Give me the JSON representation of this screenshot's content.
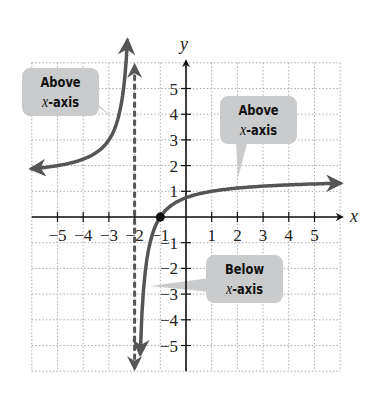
{
  "chart_data": {
    "type": "line",
    "title": "",
    "xlabel": "x",
    "ylabel": "y",
    "xlim": [
      -6,
      6
    ],
    "ylim": [
      -6,
      6
    ],
    "grid": true,
    "x_ticks": [
      -5,
      -4,
      -3,
      -2,
      -1,
      1,
      2,
      3,
      4,
      5
    ],
    "x_tick_labels": [
      "−5",
      "−4",
      "−3",
      "−2",
      "−1",
      "1",
      "2",
      "3",
      "4",
      "5"
    ],
    "y_ticks": [
      5,
      4,
      3,
      2,
      1,
      -1,
      -2,
      -3,
      -4,
      -5
    ],
    "y_tick_labels": [
      "5",
      "4",
      "3",
      "2",
      "1",
      "−1",
      "−2",
      "−3",
      "−4",
      "−5"
    ],
    "vertical_asymptote": {
      "x": -2,
      "style": "dashed"
    },
    "x_intercept": {
      "x": -1,
      "y": 0
    },
    "series": [
      {
        "name": "left branch",
        "x": [
          -6,
          -5,
          -4,
          -3,
          -2.6,
          -2.35
        ],
        "y": [
          1.88,
          2.0,
          2.25,
          3.0,
          4.5,
          7.0
        ]
      },
      {
        "name": "right branch",
        "x": [
          -1.78,
          -1.5,
          -1,
          0,
          1,
          2,
          3,
          4,
          5,
          6
        ],
        "y": [
          -5.3,
          -1.5,
          0,
          0.75,
          1.0,
          1.13,
          1.2,
          1.25,
          1.29,
          1.31
        ]
      }
    ],
    "annotations": [
      {
        "line1": "Above",
        "line2_var": "x",
        "line2_rest": "-axis",
        "target": "left branch"
      },
      {
        "line1": "Above",
        "line2_var": "x",
        "line2_rest": "-axis",
        "target": "right branch, x > -1"
      },
      {
        "line1": "Below",
        "line2_var": "x",
        "line2_rest": "-axis",
        "target": "right branch, -2 < x < -1"
      }
    ]
  },
  "axes": {
    "x_label": "x",
    "y_label": "y"
  },
  "callouts": {
    "left": {
      "line1": "Above",
      "var": "x",
      "rest": "-axis"
    },
    "right": {
      "line1": "Above",
      "var": "x",
      "rest": "-axis"
    },
    "below": {
      "line1": "Below",
      "var": "x",
      "rest": "-axis"
    }
  },
  "colors": {
    "curve": "#555555",
    "axis": "#111111",
    "grid": "#aaaaaa",
    "callout": "#c9cbcc",
    "asymptote": "#555555"
  }
}
